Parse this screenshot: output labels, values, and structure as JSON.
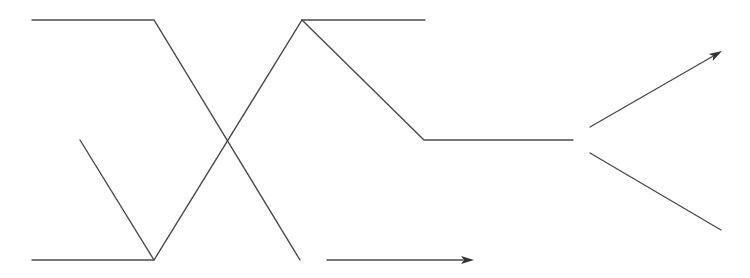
{
  "diagram": {
    "type": "line-diagram",
    "colors": {
      "background": "#ffffff",
      "stroke": "#4a4a4a",
      "arrowhead": "#333333"
    },
    "paths": [
      {
        "name": "upper-path",
        "points": [
          [
            32,
            20
          ],
          [
            154,
            20
          ],
          [
            300,
            260
          ]
        ]
      },
      {
        "name": "lower-path",
        "points": [
          [
            32,
            260
          ],
          [
            154,
            260
          ],
          [
            302,
            20
          ],
          [
            425,
            20
          ]
        ]
      },
      {
        "name": "left-short-diagonal",
        "points": [
          [
            80,
            140
          ],
          [
            154,
            260
          ]
        ]
      },
      {
        "name": "descending-to-middle",
        "points": [
          [
            302,
            20
          ],
          [
            424,
            140
          ],
          [
            573,
            140
          ]
        ]
      },
      {
        "name": "lower-right-branch",
        "points": [
          [
            590,
            153
          ],
          [
            721,
            230
          ]
        ]
      }
    ],
    "arrows": [
      {
        "name": "bottom-arrow",
        "from": [
          327,
          260
        ],
        "to": [
          474,
          260
        ]
      },
      {
        "name": "upper-right-arrow",
        "from": [
          590,
          127
        ],
        "to": [
          722,
          51
        ]
      }
    ],
    "labels": []
  }
}
